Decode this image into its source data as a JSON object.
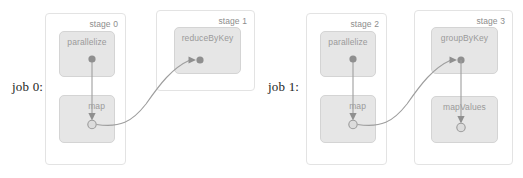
{
  "diagram": {
    "colors": {
      "stage_border": "#e3e3e3",
      "stage_fill": "#ffffff",
      "node_fill": "#e6e6e6",
      "node_border": "#d4d4d4",
      "node_label": "#9a9a9a",
      "stage_label": "#8d8d8d",
      "edge": "#9e9e9e",
      "dot_filled": "#8f8f8f",
      "dot_open": "#dcdcdc",
      "job_label": "#1d1d1d",
      "background": "#ffffff"
    }
  },
  "jobs": [
    {
      "label": "job 0:"
    },
    {
      "label": "job 1:"
    }
  ],
  "stages": [
    {
      "label": "stage 0"
    },
    {
      "label": "stage 1"
    },
    {
      "label": "stage 2"
    },
    {
      "label": "stage 3"
    }
  ],
  "nodes": [
    {
      "label": "parallelize"
    },
    {
      "label": "map"
    },
    {
      "label": "reduceByKey"
    },
    {
      "label": "parallelize"
    },
    {
      "label": "map"
    },
    {
      "label": "groupByKey"
    },
    {
      "label": "mapValues"
    }
  ]
}
